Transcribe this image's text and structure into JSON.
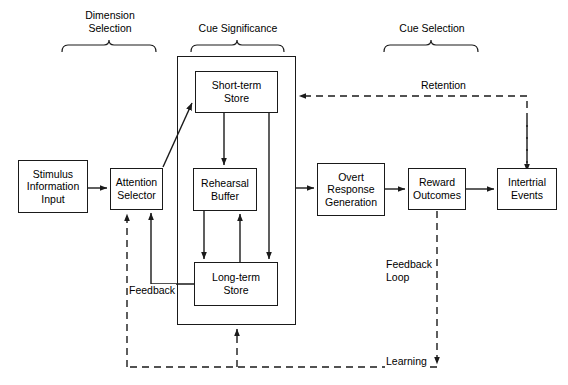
{
  "diagram": {
    "groups": [
      {
        "id": "dimension-selection",
        "label": "Dimension\nSelection",
        "x": 60,
        "y": 9,
        "w": 100,
        "bracket_x": 62,
        "bracket_y": 44,
        "bracket_w": 96
      },
      {
        "id": "cue-significance",
        "label": "Cue Significance",
        "x": 180,
        "y": 22,
        "w": 116,
        "bracket_x": 190,
        "bracket_y": 44,
        "bracket_w": 96
      },
      {
        "id": "cue-selection",
        "label": "Cue Selection",
        "x": 378,
        "y": 22,
        "w": 108,
        "bracket_x": 382,
        "bracket_y": 44,
        "bracket_w": 100
      }
    ],
    "frames": [
      {
        "id": "cue-significance-frame",
        "x": 177,
        "y": 56,
        "w": 119,
        "h": 269
      }
    ],
    "nodes": [
      {
        "id": "stimulus-information-input",
        "label": "Stimulus\nInformation\nInput",
        "x": 18,
        "y": 160,
        "w": 70,
        "h": 53
      },
      {
        "id": "attention-selector",
        "label": "Attention\nSelector",
        "x": 110,
        "y": 168,
        "w": 53,
        "h": 42
      },
      {
        "id": "short-term-store",
        "label": "Short-term\nStore",
        "x": 195,
        "y": 71,
        "w": 83,
        "h": 42
      },
      {
        "id": "rehearsal-buffer",
        "label": "Rehearsal\nBuffer",
        "x": 193,
        "y": 168,
        "w": 64,
        "h": 43
      },
      {
        "id": "long-term-store",
        "label": "Long-term\nStore",
        "x": 194,
        "y": 262,
        "w": 84,
        "h": 44
      },
      {
        "id": "overt-response-generation",
        "label": "Overt\nResponse\nGeneration",
        "x": 317,
        "y": 163,
        "w": 68,
        "h": 53
      },
      {
        "id": "reward-outcomes",
        "label": "Reward\nOutcomes",
        "x": 408,
        "y": 168,
        "w": 58,
        "h": 42
      },
      {
        "id": "intertrial-events",
        "label": "Intertrial\nEvents",
        "x": 497,
        "y": 168,
        "w": 60,
        "h": 42
      }
    ],
    "edge_labels": [
      {
        "id": "retention-label",
        "label": "Retention",
        "x": 420,
        "y": 79
      },
      {
        "id": "feedback-label",
        "label": "Feedback",
        "x": 128,
        "y": 284
      },
      {
        "id": "feedback-loop-label",
        "label": "Feedback\nLoop",
        "x": 385,
        "y": 258
      },
      {
        "id": "learning-label",
        "label": "Learning",
        "x": 385,
        "y": 355
      }
    ],
    "colors": {
      "stroke": "#1a1a1a",
      "text": "#000000",
      "background": "#ffffff"
    }
  }
}
